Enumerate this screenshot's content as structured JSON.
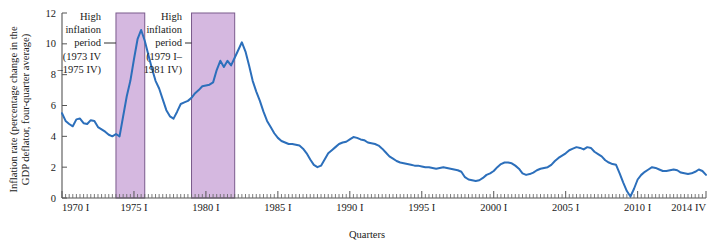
{
  "figure": {
    "background_color": "#ffffff",
    "line_color": "#2c6fbb",
    "band_fill_color": "#d5b8e0",
    "band_border_color": "#7a5a8c",
    "axis_color": "#555555"
  },
  "chart_data": {
    "type": "line",
    "title": "",
    "xlabel": "Quarters",
    "ylabel": "Inflation rate (percentage change in the GDP deflator, four-quarter average)",
    "ylabel_line1": "Inflation rate (percentage change in the",
    "ylabel_line2": "GDP deflator, four-quarter average)",
    "ylim": [
      0,
      12
    ],
    "yticks": [
      0,
      2,
      4,
      6,
      8,
      10,
      12
    ],
    "ytick_labels": [
      "0",
      "2",
      "4",
      "6",
      "8",
      "10",
      "12"
    ],
    "xlim": [
      1970.0,
      2014.75
    ],
    "xticks": [
      1970,
      1975,
      1980,
      1985,
      1990,
      1995,
      2000,
      2005,
      2010,
      2014.75
    ],
    "xtick_labels": [
      "1970 I",
      "1975 I",
      "1980 I",
      "1985 I",
      "1990 I",
      "1995 I",
      "2000 I",
      "2005 I",
      "2010 I",
      "2014 IV"
    ],
    "minor_tick_interval_years": 0.25,
    "grid": false,
    "legend": "none",
    "series": [
      {
        "name": "Inflation rate (GDP deflator, four-quarter average)",
        "color": "#2c6fbb",
        "x": [
          1970.0,
          1970.25,
          1970.5,
          1970.75,
          1971.0,
          1971.25,
          1971.5,
          1971.75,
          1972.0,
          1972.25,
          1972.5,
          1972.75,
          1973.0,
          1973.25,
          1973.5,
          1973.75,
          1974.0,
          1974.25,
          1974.5,
          1974.75,
          1975.0,
          1975.25,
          1975.5,
          1975.75,
          1976.0,
          1976.25,
          1976.5,
          1976.75,
          1977.0,
          1977.25,
          1977.5,
          1977.75,
          1978.0,
          1978.25,
          1978.5,
          1978.75,
          1979.0,
          1979.25,
          1979.5,
          1979.75,
          1980.0,
          1980.25,
          1980.5,
          1980.75,
          1981.0,
          1981.25,
          1981.5,
          1981.75,
          1982.0,
          1982.25,
          1982.5,
          1982.75,
          1983.0,
          1983.25,
          1983.5,
          1983.75,
          1984.0,
          1984.25,
          1984.5,
          1984.75,
          1985.0,
          1985.25,
          1985.5,
          1985.75,
          1986.0,
          1986.25,
          1986.5,
          1986.75,
          1987.0,
          1987.25,
          1987.5,
          1987.75,
          1988.0,
          1988.25,
          1988.5,
          1988.75,
          1989.0,
          1989.25,
          1989.5,
          1989.75,
          1990.0,
          1990.25,
          1990.5,
          1990.75,
          1991.0,
          1991.25,
          1991.5,
          1991.75,
          1992.0,
          1992.25,
          1992.5,
          1992.75,
          1993.0,
          1993.25,
          1993.5,
          1993.75,
          1994.0,
          1994.25,
          1994.5,
          1994.75,
          1995.0,
          1995.25,
          1995.5,
          1995.75,
          1996.0,
          1996.25,
          1996.5,
          1996.75,
          1997.0,
          1997.25,
          1997.5,
          1997.75,
          1998.0,
          1998.25,
          1998.5,
          1998.75,
          1999.0,
          1999.25,
          1999.5,
          1999.75,
          2000.0,
          2000.25,
          2000.5,
          2000.75,
          2001.0,
          2001.25,
          2001.5,
          2001.75,
          2002.0,
          2002.25,
          2002.5,
          2002.75,
          2003.0,
          2003.25,
          2003.5,
          2003.75,
          2004.0,
          2004.25,
          2004.5,
          2004.75,
          2005.0,
          2005.25,
          2005.5,
          2005.75,
          2006.0,
          2006.25,
          2006.5,
          2006.75,
          2007.0,
          2007.25,
          2007.5,
          2007.75,
          2008.0,
          2008.25,
          2008.5,
          2008.75,
          2009.0,
          2009.25,
          2009.5,
          2009.75,
          2010.0,
          2010.25,
          2010.5,
          2010.75,
          2011.0,
          2011.25,
          2011.5,
          2011.75,
          2012.0,
          2012.25,
          2012.5,
          2012.75,
          2013.0,
          2013.25,
          2013.5,
          2013.75,
          2014.0,
          2014.25,
          2014.5,
          2014.75
        ],
        "y": [
          5.5,
          5.0,
          4.8,
          4.65,
          5.1,
          5.15,
          4.85,
          4.8,
          5.05,
          5.0,
          4.6,
          4.45,
          4.3,
          4.1,
          4.0,
          4.15,
          4.0,
          5.3,
          6.6,
          7.6,
          9.0,
          10.3,
          10.9,
          10.2,
          9.3,
          8.4,
          7.6,
          7.1,
          6.4,
          5.7,
          5.3,
          5.15,
          5.6,
          6.1,
          6.2,
          6.3,
          6.5,
          6.8,
          7.0,
          7.25,
          7.3,
          7.35,
          7.5,
          8.3,
          8.9,
          8.5,
          8.9,
          8.6,
          9.1,
          9.6,
          10.1,
          9.5,
          8.6,
          7.6,
          6.9,
          6.3,
          5.6,
          5.0,
          4.6,
          4.2,
          3.9,
          3.7,
          3.6,
          3.5,
          3.5,
          3.45,
          3.4,
          3.2,
          2.9,
          2.5,
          2.15,
          2.0,
          2.1,
          2.5,
          2.9,
          3.1,
          3.3,
          3.5,
          3.6,
          3.65,
          3.8,
          3.95,
          3.9,
          3.8,
          3.75,
          3.6,
          3.55,
          3.5,
          3.4,
          3.2,
          2.95,
          2.7,
          2.55,
          2.4,
          2.3,
          2.25,
          2.2,
          2.15,
          2.1,
          2.1,
          2.05,
          2.0,
          2.0,
          1.95,
          1.9,
          1.95,
          2.0,
          1.95,
          1.9,
          1.85,
          1.8,
          1.7,
          1.35,
          1.2,
          1.15,
          1.1,
          1.15,
          1.3,
          1.5,
          1.6,
          1.75,
          2.0,
          2.2,
          2.3,
          2.3,
          2.25,
          2.1,
          1.9,
          1.6,
          1.5,
          1.55,
          1.65,
          1.8,
          1.9,
          1.95,
          2.0,
          2.15,
          2.4,
          2.6,
          2.75,
          2.9,
          3.1,
          3.2,
          3.3,
          3.25,
          3.15,
          3.3,
          3.25,
          3.0,
          2.85,
          2.7,
          2.45,
          2.3,
          2.2,
          2.15,
          1.6,
          1.0,
          0.45,
          0.1,
          0.6,
          1.2,
          1.5,
          1.7,
          1.85,
          2.0,
          1.95,
          1.85,
          1.75,
          1.75,
          1.8,
          1.85,
          1.8,
          1.65,
          1.6,
          1.55,
          1.6,
          1.7,
          1.85,
          1.75,
          1.5
        ]
      }
    ],
    "shaded_bands": [
      {
        "id": "band-1",
        "label": "High inflation period (1973 IV –1975 IV)",
        "x_start": 1973.75,
        "x_end": 1975.75,
        "fill": "#d5b8e0"
      },
      {
        "id": "band-2",
        "label": "High inflation period (1979 I– 1981 IV)",
        "x_start": 1979.0,
        "x_end": 1982.0,
        "fill": "#d5b8e0"
      }
    ],
    "annotations": [
      {
        "id": "annotation-1",
        "lines": [
          "High",
          "inflation",
          "period",
          "(1973 IV",
          "–1975 IV)"
        ],
        "leader_on_line_index": 2
      },
      {
        "id": "annotation-2",
        "lines": [
          "High",
          "inflation",
          "period",
          "(1979 I–",
          "1981 IV)"
        ],
        "leader_on_line_index": 2
      }
    ]
  }
}
